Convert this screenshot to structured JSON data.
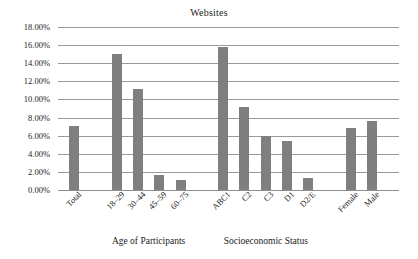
{
  "chart_data": {
    "type": "bar",
    "title": "Websites",
    "xlabel": "",
    "ylabel": "",
    "ylim": [
      0,
      18
    ],
    "yunit": "%",
    "grid": true,
    "legend": "none",
    "ytick_labels": [
      "18.00%",
      "16.00%",
      "14.00%",
      "12.00%",
      "10.00%",
      "8.00%",
      "6.00%",
      "4.00%",
      "2.00%",
      "0.00%"
    ],
    "ytick_values": [
      18,
      16,
      14,
      12,
      10,
      8,
      6,
      4,
      2,
      0
    ],
    "categories": [
      "Total",
      "18–29",
      "30–44",
      "45–59",
      "60–75",
      "ABC1",
      "C2",
      "C3",
      "D1",
      "D2/E",
      "Female",
      "Male"
    ],
    "values": [
      7.1,
      15.0,
      11.2,
      1.7,
      1.15,
      15.8,
      9.2,
      6.0,
      5.4,
      1.35,
      6.8,
      7.6
    ],
    "bar_color": "#7f7f7f",
    "gridline_color": "#9a9a9a",
    "background_color": "#ffffff",
    "groups": [
      {
        "label": "",
        "categories": [
          "Total"
        ]
      },
      {
        "label": "Age of Participants",
        "categories": [
          "18–29",
          "30–44",
          "45–59",
          "60–75"
        ]
      },
      {
        "label": "Socioeconomic Status",
        "categories": [
          "ABC1",
          "C2",
          "C3",
          "D1",
          "D2/E"
        ]
      },
      {
        "label": "",
        "categories": [
          "Female",
          "Male"
        ]
      }
    ],
    "group_titles": [
      "Age of Participants",
      "Socioeconomic Status"
    ]
  }
}
